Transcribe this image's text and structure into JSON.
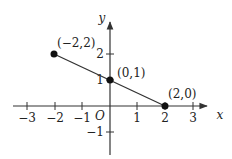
{
  "diagram": {
    "type": "coordinate-plane",
    "axes": {
      "x_label": "x",
      "y_label": "y",
      "origin_label": "O",
      "x_ticks": [
        {
          "value": -3,
          "label": "−3"
        },
        {
          "value": -2,
          "label": "−2"
        },
        {
          "value": -1,
          "label": "−1"
        },
        {
          "value": 1,
          "label": "1"
        },
        {
          "value": 2,
          "label": "2"
        },
        {
          "value": 3,
          "label": "3"
        }
      ],
      "y_ticks": [
        {
          "value": 2,
          "label": "2"
        },
        {
          "value": 1,
          "label": "1"
        },
        {
          "value": -1,
          "label": "−1"
        }
      ]
    },
    "points": [
      {
        "x": -2,
        "y": 2,
        "label": "(−2,2)"
      },
      {
        "x": 0,
        "y": 1,
        "label": "(0,1)"
      },
      {
        "x": 2,
        "y": 0,
        "label": "(2,0)"
      }
    ],
    "segment": {
      "from": [
        -2,
        2
      ],
      "to": [
        2,
        0
      ]
    },
    "colors": {
      "axis": "#333333",
      "line": "#333333",
      "point": "#111111"
    }
  }
}
